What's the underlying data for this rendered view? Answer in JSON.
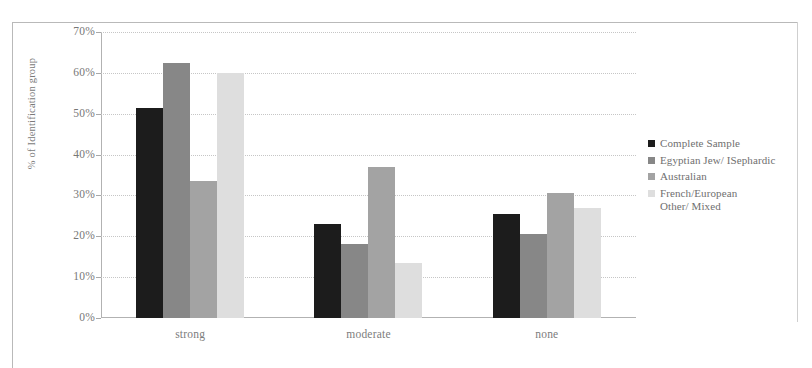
{
  "chart_data": {
    "type": "bar",
    "title": "",
    "subtitle": "",
    "xlabel": "",
    "ylabel": "% of Identification group",
    "categories": [
      "strong",
      "moderate",
      "none"
    ],
    "ylim": [
      0,
      70
    ],
    "ytick_labels": [
      "70%",
      "60%",
      "50%",
      "40%",
      "30%",
      "20%",
      "10%",
      "0%"
    ],
    "ytick_values": [
      70,
      60,
      50,
      40,
      30,
      20,
      10,
      0
    ],
    "grid": true,
    "legend_position": "right",
    "series": [
      {
        "name": "Complete Sample",
        "color": "#1c1c1c",
        "values": [
          51.5,
          23.0,
          25.5
        ]
      },
      {
        "name": "Egyptian Jew/ ISephardic",
        "color": "#878787",
        "values": [
          62.5,
          18.0,
          20.5
        ]
      },
      {
        "name": "Australian",
        "color": "#a3a3a3",
        "values": [
          33.5,
          37.0,
          30.5
        ]
      },
      {
        "name": "French/European",
        "name_line2": "Other/ Mixed",
        "color": "#dedede",
        "values": [
          60.0,
          13.5,
          27.0
        ]
      }
    ]
  },
  "legend": {
    "entries": [
      {
        "label": "Complete Sample",
        "label2": ""
      },
      {
        "label": "Egyptian Jew/ ISephardic",
        "label2": ""
      },
      {
        "label": "Australian",
        "label2": ""
      },
      {
        "label": "French/European",
        "label2": "Other/ Mixed"
      }
    ]
  },
  "axis": {
    "y_title": "% of Identification group"
  }
}
